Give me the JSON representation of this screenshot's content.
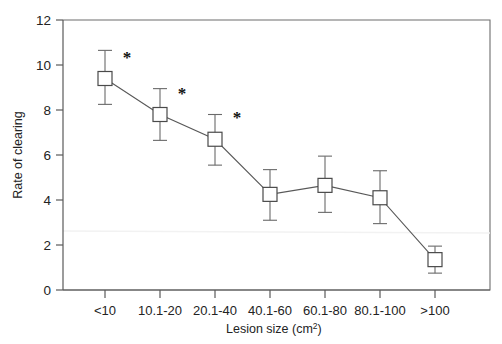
{
  "chart_data": {
    "type": "line",
    "title": "",
    "subtitle": "",
    "xlabel": "Lesion size (cm2)",
    "xlabel_base": "Lesion size (cm",
    "xlabel_sup": "2",
    "xlabel_tail": ")",
    "ylabel": "Rate of clearing",
    "categories": [
      "<10",
      "10.1-20",
      "20.1-40",
      "40.1-60",
      "60.1-80",
      "80.1-100",
      ">100"
    ],
    "values": [
      9.4,
      7.8,
      6.7,
      4.25,
      4.65,
      4.1,
      1.35
    ],
    "error_low": [
      8.25,
      6.65,
      5.55,
      3.1,
      3.45,
      2.95,
      0.75
    ],
    "error_high": [
      10.65,
      8.95,
      7.8,
      5.35,
      5.95,
      5.3,
      1.95
    ],
    "significance_markers": [
      "*",
      "*",
      "*",
      "",
      "",
      "",
      ""
    ],
    "significance_symbol": "*",
    "ylim": [
      0,
      12
    ],
    "yticks": [
      0,
      2,
      4,
      6,
      8,
      10,
      12
    ],
    "ytick_labels": [
      "0",
      "2",
      "4",
      "6",
      "8",
      "10",
      "12"
    ],
    "grid": false,
    "legend": false,
    "legend_position": "none",
    "marker_style": "open-square",
    "series": [
      {
        "name": "Rate of clearing",
        "values": [
          9.4,
          7.8,
          6.7,
          4.25,
          4.65,
          4.1,
          1.35
        ]
      }
    ]
  },
  "colors": {
    "line": "#585858",
    "marker_fill": "#ffffff",
    "marker_stroke": "#4a4a4a",
    "axis": "#5a5a5a",
    "text": "#232323",
    "background": "#ffffff"
  }
}
